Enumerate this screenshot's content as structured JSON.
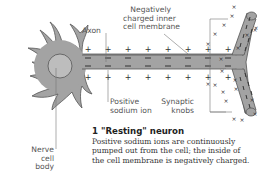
{
  "figure": {
    "labels": {
      "axon": "Axon",
      "membrane": [
        "Negatively",
        "charged inner",
        "cell membrane"
      ],
      "sodium": [
        "Positive",
        "sodium ion"
      ],
      "synaptic": [
        "Synaptic",
        "knobs"
      ],
      "cell_body": [
        "Nerve",
        "cell",
        "body"
      ]
    },
    "caption": {
      "title": "1 \"Resting\" neuron",
      "lines": [
        "Positive sodium ions are continuously",
        "pumped out from the cell; the inside of",
        "the cell membrane is negatively charged."
      ]
    },
    "symbols": {
      "outside_charge": "+",
      "inside_charge": "−",
      "terminal_outside": "×"
    },
    "colors": {
      "cell_fill": "#a3a3a3",
      "cell_outline": "#555555",
      "nucleus_fill": "#bdbdbd",
      "label_text": "#555555",
      "leader_line": "#777777"
    }
  }
}
